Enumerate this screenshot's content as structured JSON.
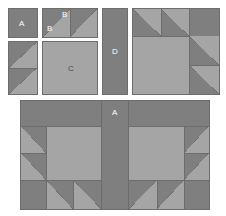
{
  "diagram": {
    "canvas": {
      "width": 226,
      "height": 216
    },
    "colors": {
      "dark_fabric": "#807f7f",
      "light_fabric": "#a5a5a5",
      "seam_line": "#6e6d6d",
      "background": "#ffffff",
      "label_light": "#ffffff",
      "label_dark": "#4d4c4c"
    },
    "labels": {
      "a_square": "A",
      "b_triangle_light": "B",
      "b_triangle_dark": "B",
      "c_square": "C",
      "d_rectangle": "D",
      "a_sash_center": "A"
    },
    "units": [
      {
        "id": "unit-a",
        "name": "square-a",
        "label": "A",
        "shape": "solid-square",
        "fabric": "dark",
        "x": 8,
        "y": 8,
        "width": 30,
        "height": 30
      },
      {
        "id": "unit-b",
        "name": "half-square-triangle-pair-b",
        "label": "B",
        "shape": "two-half-square-triangles",
        "dark_corner": "top-left",
        "x": 42,
        "y": 8,
        "width": 56,
        "height": 30
      },
      {
        "id": "unit-left-hst-column",
        "name": "half-square-triangle-column",
        "label": "",
        "shape": "two-stacked-half-square-triangles",
        "dark_corner": "top-left",
        "x": 8,
        "y": 41,
        "width": 30,
        "height": 54
      },
      {
        "id": "unit-c",
        "name": "square-c",
        "label": "C",
        "shape": "solid-square",
        "fabric": "light",
        "x": 42,
        "y": 41,
        "width": 56,
        "height": 54
      },
      {
        "id": "unit-d",
        "name": "rectangle-d",
        "label": "D",
        "shape": "solid-rectangle",
        "fabric": "dark",
        "x": 102,
        "y": 8,
        "width": 26,
        "height": 87
      },
      {
        "id": "unit-quarter-block",
        "name": "quarter-block-assembly",
        "label": "",
        "shape": "composite-block",
        "x": 132,
        "y": 8,
        "width": 88,
        "height": 87
      },
      {
        "id": "unit-full-block",
        "name": "full-block-assembly",
        "label": "A",
        "shape": "composite-block",
        "x": 20,
        "y": 100,
        "width": 190,
        "height": 110
      }
    ]
  }
}
